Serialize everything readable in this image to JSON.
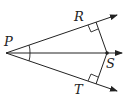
{
  "diagram": {
    "type": "geometry",
    "points": {
      "P": {
        "label": "P",
        "x": 6,
        "y": 53
      },
      "R": {
        "label": "R",
        "x": 96,
        "y": 22
      },
      "S": {
        "label": "S",
        "x": 107,
        "y": 53
      },
      "T": {
        "label": "T",
        "x": 96,
        "y": 84
      }
    },
    "rays": [
      {
        "from": "P",
        "through": "R"
      },
      {
        "from": "P",
        "through": "S"
      },
      {
        "from": "P",
        "through": "T"
      }
    ],
    "segments": [
      [
        "S",
        "R"
      ],
      [
        "S",
        "T"
      ]
    ],
    "right_angles": [
      "R",
      "T"
    ],
    "congruent_angles": [
      "RPS",
      "SPT"
    ],
    "colors": {
      "stroke": "#222222"
    }
  }
}
